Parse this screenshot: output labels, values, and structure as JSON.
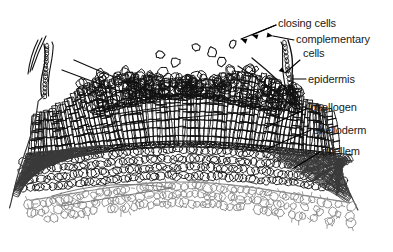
{
  "figure": {
    "background_color": "#ffffff",
    "ink_color": "#1a1a1a",
    "labels": [
      {
        "id": "closing-cells",
        "text": "closing cells",
        "x": 278,
        "y": 27,
        "anchor": "start"
      },
      {
        "id": "complementary-cells-line1",
        "text": "complementary",
        "x": 296,
        "y": 43,
        "anchor": "start"
      },
      {
        "id": "complementary-cells-line2",
        "text": "cells",
        "x": 303,
        "y": 57,
        "anchor": "start"
      },
      {
        "id": "epidermis",
        "text": "epidermis",
        "x": 308,
        "y": 83,
        "anchor": "start"
      },
      {
        "id": "phellogen",
        "text": "phellogen",
        "x": 310,
        "y": 111,
        "anchor": "start"
      },
      {
        "id": "phelloderm",
        "text": "phelloderm",
        "x": 313,
        "y": 134,
        "anchor": "start"
      },
      {
        "id": "phellem",
        "text": "phellem",
        "x": 322,
        "y": 155,
        "anchor": "start"
      }
    ],
    "leaders": [
      {
        "id": "leader-closing-cells-a",
        "path": "M 276 25 L 252 35"
      },
      {
        "id": "leader-closing-cells-b",
        "path": "M 276 25 L 241 39"
      },
      {
        "id": "leader-complementary-a",
        "path": "M 294 40 L 273 36"
      },
      {
        "id": "leader-complementary-b",
        "path": "M 300 60 L 285 73"
      },
      {
        "id": "leader-epidermis",
        "path": "M 306 79 L 293 79"
      },
      {
        "id": "leader-epidermis-tick",
        "path": "M 293 75 L 293 84"
      },
      {
        "id": "leader-phellogen",
        "path": "M 308 108 L 265 128"
      },
      {
        "id": "leader-phelloderm",
        "path": "M 311 130 L 262 151"
      },
      {
        "id": "leader-phellem",
        "path": "M 320 152 L 294 168"
      }
    ],
    "structure": {
      "description": "Lenticel in bark: outward-bulging mass of loose complementary cells at top centre, flanked by radial files of phellem; epidermis at outer flank; phellogen band; phelloderm below; inner cortex cells along the base.",
      "zones": [
        {
          "name": "complementary-cells-zone",
          "note": "rounded loose cells, top centre"
        },
        {
          "name": "closing-layer-zone",
          "note": "compact arc of cells over complementary cells"
        },
        {
          "name": "phellem-zone",
          "note": "radial files of brick-like cells, flanks"
        },
        {
          "name": "phellogen-zone",
          "note": "thin continuous band of flat cells"
        },
        {
          "name": "phelloderm-zone",
          "note": "rows of cells inside phellogen"
        },
        {
          "name": "cortex-zone",
          "note": "pale rounded cells with spiky walls at base"
        }
      ]
    }
  }
}
